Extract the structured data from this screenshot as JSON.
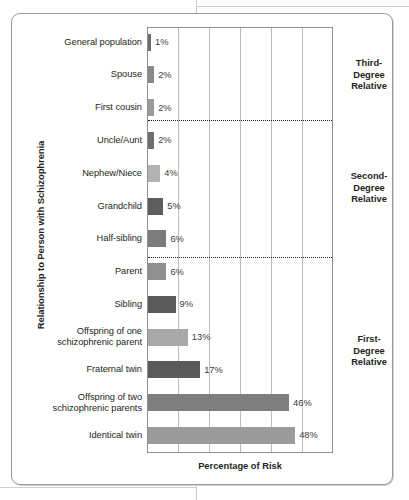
{
  "chart_data": {
    "type": "bar",
    "orientation": "horizontal",
    "title": "",
    "xlabel": "Percentage of Risk",
    "ylabel": "Relationship to Person with Schizophrenia",
    "xlim": [
      0,
      60
    ],
    "grid": true,
    "gridlines": [
      0,
      10,
      20,
      30,
      40,
      50,
      60
    ],
    "legend": "none",
    "categories": [
      "General population",
      "Spouse",
      "First cousin",
      "Uncle/Aunt",
      "Nephew/Niece",
      "Grandchild",
      "Half-sibling",
      "Parent",
      "Sibling",
      "Offspring of one schizophrenic parent",
      "Fraternal twin",
      "Offspring of two schizophrenic parents",
      "Identical twin"
    ],
    "values": [
      1,
      2,
      2,
      2,
      4,
      5,
      6,
      6,
      9,
      13,
      17,
      46,
      48
    ],
    "value_labels": [
      "1%",
      "2%",
      "2%",
      "2%",
      "4%",
      "5%",
      "6%",
      "6%",
      "9%",
      "13%",
      "17%",
      "46%",
      "48%"
    ],
    "bar_colors": [
      "#6d6d6d",
      "#8a8a8a",
      "#9a9a9a",
      "#6f6f6f",
      "#b3b3b3",
      "#5d5d5d",
      "#7c7c7c",
      "#8f8f8f",
      "#5a5a5a",
      "#a8a8a8",
      "#5a5a5a",
      "#7e7e7e",
      "#9b9b9b"
    ]
  },
  "bars": [
    {
      "label": "General population",
      "value_label": "1%",
      "label_line2": ""
    },
    {
      "label": "Spouse",
      "value_label": "2%",
      "label_line2": ""
    },
    {
      "label": "First cousin",
      "value_label": "2%",
      "label_line2": ""
    },
    {
      "label": "Uncle/Aunt",
      "value_label": "2%",
      "label_line2": ""
    },
    {
      "label": "Nephew/Niece",
      "value_label": "4%",
      "label_line2": ""
    },
    {
      "label": "Grandchild",
      "value_label": "5%",
      "label_line2": ""
    },
    {
      "label": "Half-sibling",
      "value_label": "6%",
      "label_line2": ""
    },
    {
      "label": "Parent",
      "value_label": "6%",
      "label_line2": ""
    },
    {
      "label": "Sibling",
      "value_label": "9%",
      "label_line2": ""
    },
    {
      "label": "Offspring of one",
      "value_label": "13%",
      "label_line2": "schizophrenic parent"
    },
    {
      "label": "Fraternal twin",
      "value_label": "17%",
      "label_line2": ""
    },
    {
      "label": "Offspring of two",
      "value_label": "46%",
      "label_line2": "schizophrenic parents"
    },
    {
      "label": "Identical twin",
      "value_label": "48%",
      "label_line2": ""
    }
  ],
  "groups": [
    {
      "name": "third-degree",
      "line1": "Third-",
      "line2": "Degree",
      "line3": "Relative"
    },
    {
      "name": "second-degree",
      "line1": "Second-",
      "line2": "Degree",
      "line3": "Relative"
    },
    {
      "name": "first-degree",
      "line1": "First-",
      "line2": "Degree",
      "line3": "Relative"
    }
  ],
  "axes": {
    "x_title": "Percentage of Risk",
    "y_title": "Relationship to Person with Schizophrenia"
  }
}
